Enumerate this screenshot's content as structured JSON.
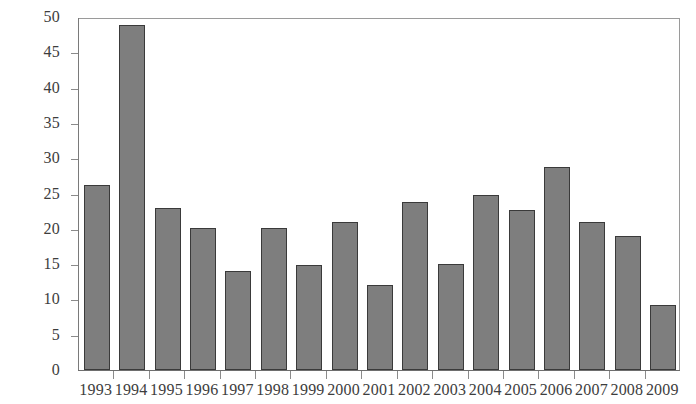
{
  "chart_data": {
    "type": "bar",
    "title": "",
    "xlabel": "",
    "ylabel": "",
    "categories": [
      "1993",
      "1994",
      "1995",
      "1996",
      "1997",
      "1998",
      "1999",
      "2000",
      "2001",
      "2002",
      "2003",
      "2004",
      "2005",
      "2006",
      "2007",
      "2008",
      "2009"
    ],
    "values": [
      26.2,
      48.9,
      23.0,
      20.1,
      14.0,
      20.1,
      14.9,
      21.0,
      12.0,
      23.8,
      15.0,
      24.8,
      22.7,
      28.8,
      21.0,
      19.0,
      9.2
    ],
    "ylim": [
      0,
      50
    ],
    "ytick_step": 5,
    "yticks": [
      0,
      5,
      10,
      15,
      20,
      25,
      30,
      35,
      40,
      45,
      50
    ],
    "ytick_labels": [
      "0",
      "5",
      "10",
      "15",
      "20",
      "25",
      "30",
      "35",
      "40",
      "45",
      "50"
    ],
    "grid": false,
    "legend": null,
    "legend_position": "none",
    "bar_color": "#7e7e7e",
    "bar_border_color": "#3a3a3a",
    "axis_color": "#8b8b8b",
    "background_color": "#ffffff",
    "text_color": "#3d3d3d"
  }
}
